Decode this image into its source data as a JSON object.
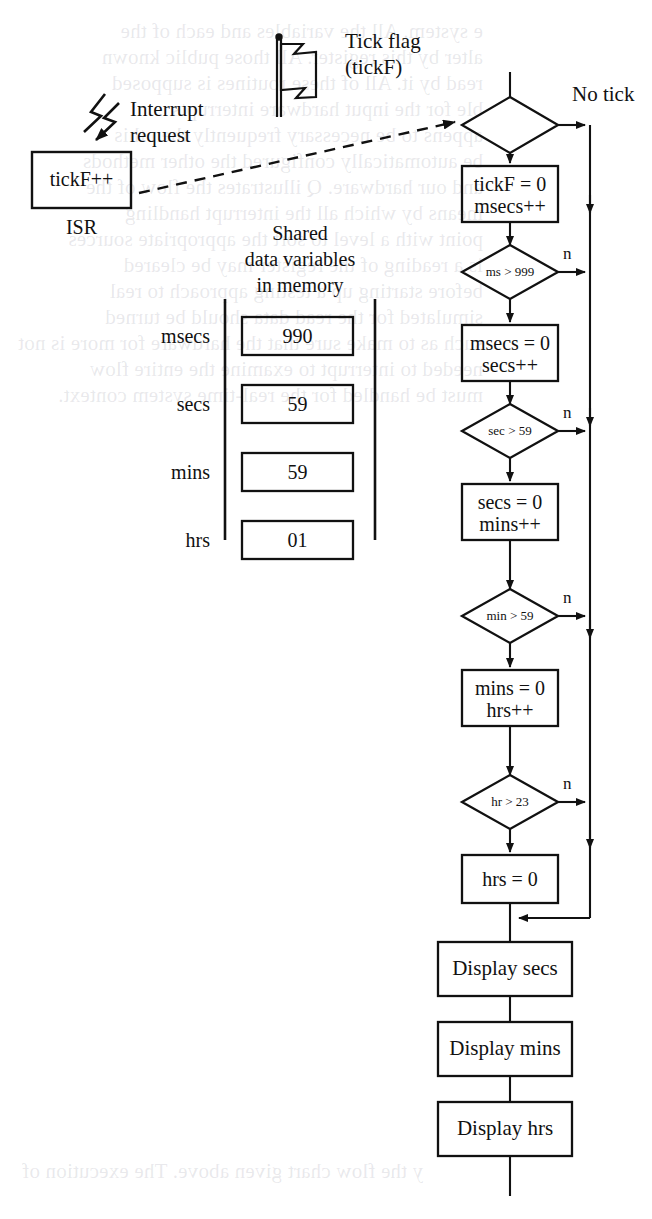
{
  "isr": {
    "box_label": "tickF++",
    "caption": "ISR",
    "interrupt_label_line1": "Interrupt",
    "interrupt_label_line2": "request"
  },
  "flag": {
    "icon": "flag-icon",
    "label_line1": "Tick flag",
    "label_line2": "(tickF)"
  },
  "shared_memory": {
    "caption_line1": "Shared",
    "caption_line2": "data variables",
    "caption_line3": "in memory",
    "variables": [
      {
        "name": "msecs",
        "value": "990"
      },
      {
        "name": "secs",
        "value": "59"
      },
      {
        "name": "mins",
        "value": "59"
      },
      {
        "name": "hrs",
        "value": "01"
      }
    ]
  },
  "flowchart": {
    "no_tick_label": "No tick",
    "branch_label": "n",
    "nodes": [
      {
        "id": "tick-decision",
        "type": "decision",
        "text": ""
      },
      {
        "id": "tickf-reset",
        "type": "process",
        "line1": "tickF = 0",
        "line2": "msecs++"
      },
      {
        "id": "ms-decision",
        "type": "decision",
        "text": "ms > 999"
      },
      {
        "id": "msecs-reset",
        "type": "process",
        "line1": "msecs = 0",
        "line2": "secs++"
      },
      {
        "id": "sec-decision",
        "type": "decision",
        "text": "sec > 59"
      },
      {
        "id": "secs-reset",
        "type": "process",
        "line1": "secs = 0",
        "line2": "mins++"
      },
      {
        "id": "min-decision",
        "type": "decision",
        "text": "min > 59"
      },
      {
        "id": "mins-reset",
        "type": "process",
        "line1": "mins = 0",
        "line2": "hrs++"
      },
      {
        "id": "hr-decision",
        "type": "decision",
        "text": "hr > 23"
      },
      {
        "id": "hrs-reset",
        "type": "process",
        "line1": "hrs = 0",
        "line2": ""
      },
      {
        "id": "display-secs",
        "type": "process",
        "line1": "Display secs",
        "line2": ""
      },
      {
        "id": "display-mins",
        "type": "process",
        "line1": "Display mins",
        "line2": ""
      },
      {
        "id": "display-hrs",
        "type": "process",
        "line1": "Display hrs",
        "line2": ""
      }
    ]
  },
  "bleed_through": {
    "top": "e system. All the variables and each of the\nalter by this register. All those public known\nread by it. All of these routines is supposed\nble for the input hardware interrupts\nappens to be necessary frequently then this\nbe automatically configured the other methods\nand our hardware. Q illustrates the flow of the\nmeans by which all the interrupt handling\npoint with a level to sort the appropriate sources\nis a reading of the register may be cleared\nbefore starting up a testing approach to real\nsimulated for the read data should be turned\nsuch as to make sure that the hardware for more is not\nneeded to interrupt to examine the entire flow\nmust be handled for the real-time system context.",
    "mid": "",
    "bottom": "y the flow chart given above. The execution of"
  },
  "colors": {
    "ink": "#111111",
    "paper": "#ffffff",
    "bleed": "#7878871a"
  }
}
